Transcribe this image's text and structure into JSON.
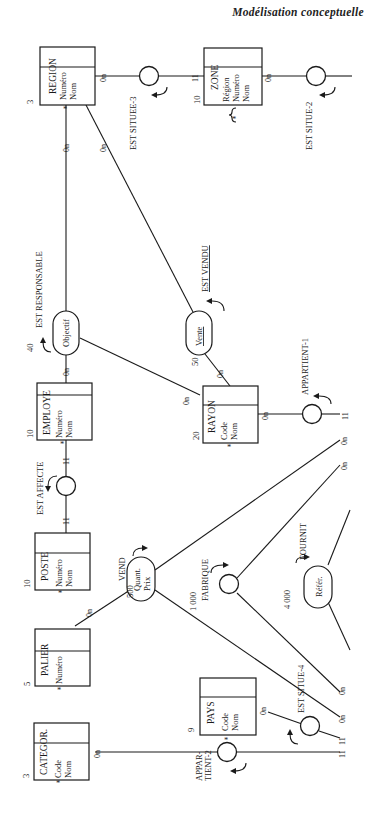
{
  "page": {
    "header": "Modélisation conceptuelle"
  },
  "entities": {
    "region": {
      "name": "REGION",
      "attrs": [
        "Numéro",
        "Nom"
      ],
      "count": "3"
    },
    "zone": {
      "name": "ZONE",
      "attrs": [
        "Région",
        "Numéro",
        "Nom"
      ],
      "count": "10"
    },
    "employe": {
      "name": "EMPLOYE",
      "attrs": [
        "Numéro",
        "Nom"
      ],
      "count": "10"
    },
    "rayon": {
      "name": "RAYON",
      "attrs": [
        "Code",
        "Nom"
      ],
      "count": "20"
    },
    "poste": {
      "name": "POSTE",
      "attrs": [
        "Numéro",
        "Nom"
      ],
      "count": "10"
    },
    "palier": {
      "name": "PALIER",
      "attrs": [
        "Numéro"
      ],
      "count": "5"
    },
    "categor": {
      "name": "CATEGOR.",
      "attrs": [
        "Code",
        "Nom"
      ],
      "count": "3"
    },
    "pays": {
      "name": "PAYS",
      "attrs": [
        "Code",
        "Nom"
      ],
      "count": "9"
    }
  },
  "relations": {
    "est_situee_3": {
      "label": "EST SITUEE-3"
    },
    "est_situe_2": {
      "label": "EST SITUE-2"
    },
    "est_responsable": {
      "label": "EST RESPONSABLE",
      "attr": "Objectif",
      "count": "40"
    },
    "est_vendu": {
      "label": "EST VENDU",
      "attr": "Vente",
      "count": "50"
    },
    "appartient_1": {
      "label": "APPARTIENT-1"
    },
    "est_affecte": {
      "label": "EST AFFECTE"
    },
    "vend": {
      "label": "VEND",
      "attrs": [
        "Quant.",
        "Prix"
      ],
      "count": "500"
    },
    "fabrique": {
      "label": "FABRIQUE",
      "count": "1 000"
    },
    "fournit": {
      "label": "FOURNIT",
      "attr": "Référ.",
      "count": "4 000"
    },
    "est_situe_4": {
      "label": "EST SITUE-4"
    },
    "appartient_2": {
      "label": "APPAR-",
      "label2": "TIENT-2"
    }
  },
  "cardinalities": {
    "c0n": "0n",
    "c11": "11"
  },
  "identifier_marker": "*"
}
